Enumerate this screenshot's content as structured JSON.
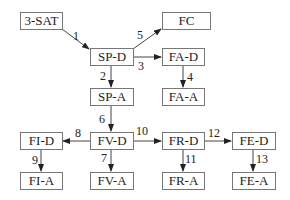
{
  "nodes": {
    "sat3": {
      "label": "3-SAT"
    },
    "fc": {
      "label": "FC"
    },
    "spd": {
      "label": "SP-D"
    },
    "fad": {
      "label": "FA-D"
    },
    "spa": {
      "label": "SP-A"
    },
    "faa": {
      "label": "FA-A"
    },
    "fid": {
      "label": "FI-D"
    },
    "fvd": {
      "label": "FV-D"
    },
    "frd": {
      "label": "FR-D"
    },
    "fed": {
      "label": "FE-D"
    },
    "fia": {
      "label": "FI-A"
    },
    "fva": {
      "label": "FV-A"
    },
    "fra": {
      "label": "FR-A"
    },
    "fea": {
      "label": "FE-A"
    }
  },
  "edges": [
    {
      "id": "1",
      "from": "3-SAT",
      "to": "SP-D"
    },
    {
      "id": "2",
      "from": "SP-D",
      "to": "SP-A"
    },
    {
      "id": "3",
      "from": "SP-D",
      "to": "FA-D"
    },
    {
      "id": "4",
      "from": "FA-D",
      "to": "FA-A"
    },
    {
      "id": "5",
      "from": "SP-D",
      "to": "FC"
    },
    {
      "id": "6",
      "from": "SP-A",
      "to": "FV-D"
    },
    {
      "id": "7",
      "from": "FV-D",
      "to": "FV-A"
    },
    {
      "id": "8",
      "from": "FV-D",
      "to": "FI-D"
    },
    {
      "id": "9",
      "from": "FI-D",
      "to": "FI-A"
    },
    {
      "id": "10",
      "from": "FV-D",
      "to": "FR-D"
    },
    {
      "id": "11",
      "from": "FR-D",
      "to": "FR-A"
    },
    {
      "id": "12",
      "from": "FR-D",
      "to": "FE-D"
    },
    {
      "id": "13",
      "from": "FE-D",
      "to": "FE-A"
    }
  ]
}
